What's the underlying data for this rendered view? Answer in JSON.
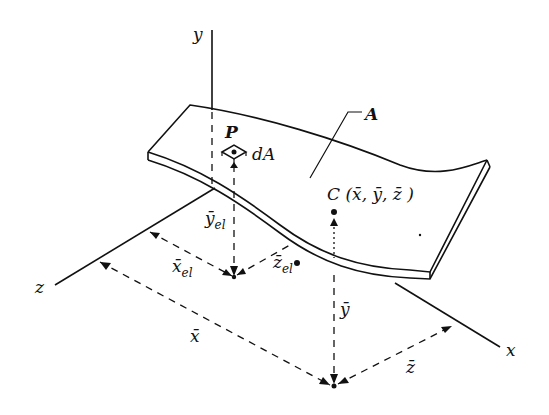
{
  "diagram": {
    "axes": {
      "x": "x",
      "y": "y",
      "z": "z"
    },
    "surface_label": "A",
    "point_label": "P",
    "element_label": "dA",
    "centroid_label": "C (x̄, ȳ, z̄ )",
    "element_coords": {
      "x": "x̄",
      "x_sub": "el",
      "y": "ȳ",
      "y_sub": "el",
      "z": "z̄",
      "z_sub": "el"
    },
    "centroid_coords": {
      "x": "x̄",
      "y": "ȳ",
      "z": "z̄"
    }
  }
}
